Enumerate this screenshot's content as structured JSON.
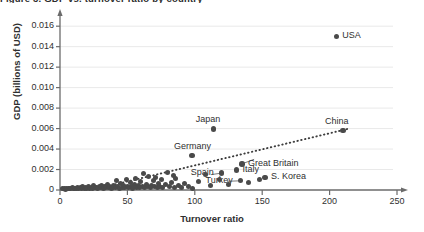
{
  "figure": {
    "title_fragment": "Figure 3. GDP vs. turnover ratio by country",
    "axis_color": "#6b6b6b",
    "point_color": "#4a4a4a",
    "grid_color": "#e9e9e9"
  },
  "chart_data": {
    "type": "scatter",
    "title": "",
    "xlabel": "Turnover ratio",
    "ylabel": "GDP (billions of USD)",
    "xlim": [
      0,
      250
    ],
    "ylim": [
      0,
      0.0168
    ],
    "xticks": [
      0,
      50,
      100,
      150,
      200,
      250
    ],
    "xtick_labels": [
      "0",
      "50",
      "100",
      "150",
      "200",
      "250"
    ],
    "yticks": [
      0,
      0.002,
      0.004,
      0.006,
      0.008,
      0.01,
      0.012,
      0.014,
      0.016
    ],
    "ytick_labels": [
      "0",
      "0.002",
      "0.004",
      "0.006",
      "0.008",
      "0.010",
      "0.012",
      "0.014",
      "0.016"
    ],
    "grid": "horizontal",
    "legend": "none",
    "trendline": {
      "style": "dotted",
      "x_start": 41,
      "y_start": 0.00055,
      "x_end": 213,
      "y_end": 0.00595
    },
    "labeled_points": [
      {
        "label": "USA",
        "x": 205,
        "y": 0.015,
        "label_side": "right"
      },
      {
        "label": "China",
        "x": 210,
        "y": 0.0058,
        "label_side": "above"
      },
      {
        "label": "Japan",
        "x": 114,
        "y": 0.00595,
        "label_side": "above"
      },
      {
        "label": "Germany",
        "x": 98,
        "y": 0.00335,
        "label_side": "above"
      },
      {
        "label": "Great Britain",
        "x": 135,
        "y": 0.00255,
        "label_side": "right"
      },
      {
        "label": "Italy",
        "x": 131,
        "y": 0.00195,
        "label_side": "right"
      },
      {
        "label": "Spain",
        "x": 120,
        "y": 0.00165,
        "label_side": "left"
      },
      {
        "label": "Turkey",
        "x": 134,
        "y": 0.0009,
        "label_side": "left"
      },
      {
        "label": "S. Korea",
        "x": 152,
        "y": 0.00125,
        "label_side": "right"
      }
    ],
    "points": [
      {
        "x": 2,
        "y": 0.0001
      },
      {
        "x": 3,
        "y": 0.00012
      },
      {
        "x": 4,
        "y": 8e-05
      },
      {
        "x": 5,
        "y": 0.00015
      },
      {
        "x": 6,
        "y": 0.0001
      },
      {
        "x": 7,
        "y": 0.00018
      },
      {
        "x": 8,
        "y": 0.00012
      },
      {
        "x": 9,
        "y": 0.00022
      },
      {
        "x": 10,
        "y": 0.0001
      },
      {
        "x": 11,
        "y": 0.00016
      },
      {
        "x": 12,
        "y": 0.00012
      },
      {
        "x": 13,
        "y": 0.00025
      },
      {
        "x": 14,
        "y": 0.00014
      },
      {
        "x": 15,
        "y": 0.0002
      },
      {
        "x": 16,
        "y": 0.00012
      },
      {
        "x": 17,
        "y": 0.0003
      },
      {
        "x": 18,
        "y": 0.00016
      },
      {
        "x": 19,
        "y": 0.00022
      },
      {
        "x": 20,
        "y": 0.00014
      },
      {
        "x": 21,
        "y": 0.00035
      },
      {
        "x": 22,
        "y": 0.00018
      },
      {
        "x": 23,
        "y": 0.00026
      },
      {
        "x": 24,
        "y": 0.00012
      },
      {
        "x": 25,
        "y": 0.0004
      },
      {
        "x": 26,
        "y": 0.0002
      },
      {
        "x": 27,
        "y": 0.00028
      },
      {
        "x": 28,
        "y": 0.00016
      },
      {
        "x": 29,
        "y": 0.00032
      },
      {
        "x": 30,
        "y": 0.00022
      },
      {
        "x": 31,
        "y": 0.00045
      },
      {
        "x": 32,
        "y": 0.00018
      },
      {
        "x": 33,
        "y": 0.0003
      },
      {
        "x": 34,
        "y": 0.00024
      },
      {
        "x": 35,
        "y": 0.00055
      },
      {
        "x": 36,
        "y": 0.0002
      },
      {
        "x": 37,
        "y": 0.00038
      },
      {
        "x": 38,
        "y": 0.00015
      },
      {
        "x": 39,
        "y": 0.00028
      },
      {
        "x": 40,
        "y": 0.00046
      },
      {
        "x": 41,
        "y": 0.00022
      },
      {
        "x": 42,
        "y": 0.00095
      },
      {
        "x": 43,
        "y": 0.0003
      },
      {
        "x": 44,
        "y": 0.00018
      },
      {
        "x": 45,
        "y": 0.0006
      },
      {
        "x": 46,
        "y": 0.00026
      },
      {
        "x": 47,
        "y": 0.0004
      },
      {
        "x": 48,
        "y": 0.0002
      },
      {
        "x": 49,
        "y": 0.00105
      },
      {
        "x": 50,
        "y": 0.00032
      },
      {
        "x": 51,
        "y": 0.00024
      },
      {
        "x": 52,
        "y": 0.0007
      },
      {
        "x": 53,
        "y": 0.00035
      },
      {
        "x": 54,
        "y": 0.00018
      },
      {
        "x": 55,
        "y": 0.0005
      },
      {
        "x": 56,
        "y": 0.00115
      },
      {
        "x": 57,
        "y": 0.00028
      },
      {
        "x": 58,
        "y": 0.00042
      },
      {
        "x": 59,
        "y": 0.00022
      },
      {
        "x": 60,
        "y": 0.0008
      },
      {
        "x": 61,
        "y": 0.00036
      },
      {
        "x": 62,
        "y": 0.0016
      },
      {
        "x": 63,
        "y": 0.00026
      },
      {
        "x": 64,
        "y": 0.00055
      },
      {
        "x": 65,
        "y": 0.0003
      },
      {
        "x": 66,
        "y": 0.00135
      },
      {
        "x": 67,
        "y": 0.0002
      },
      {
        "x": 68,
        "y": 0.00048
      },
      {
        "x": 69,
        "y": 0.0009
      },
      {
        "x": 70,
        "y": 0.00032
      },
      {
        "x": 71,
        "y": 0.00125
      },
      {
        "x": 72,
        "y": 0.00024
      },
      {
        "x": 73,
        "y": 0.00065
      },
      {
        "x": 74,
        "y": 0.00038
      },
      {
        "x": 75,
        "y": 0.001
      },
      {
        "x": 76,
        "y": 0.00028
      },
      {
        "x": 78,
        "y": 0.00056
      },
      {
        "x": 80,
        "y": 0.0017
      },
      {
        "x": 81,
        "y": 0.00034
      },
      {
        "x": 83,
        "y": 0.00075
      },
      {
        "x": 84,
        "y": 0.0014
      },
      {
        "x": 85,
        "y": 0.00026
      },
      {
        "x": 86,
        "y": 0.0011
      },
      {
        "x": 88,
        "y": 0.0004
      },
      {
        "x": 90,
        "y": 0.0002
      },
      {
        "x": 92,
        "y": 0.00068
      },
      {
        "x": 95,
        "y": 0.0003
      },
      {
        "x": 98,
        "y": 0.00018
      },
      {
        "x": 103,
        "y": 0.00085
      },
      {
        "x": 108,
        "y": 0.0015
      },
      {
        "x": 112,
        "y": 0.00042
      },
      {
        "x": 118,
        "y": 0.00098
      },
      {
        "x": 125,
        "y": 0.00058
      },
      {
        "x": 140,
        "y": 0.00072
      },
      {
        "x": 148,
        "y": 0.00105
      }
    ]
  }
}
